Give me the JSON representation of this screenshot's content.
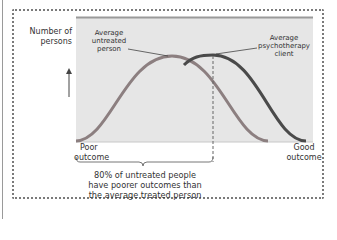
{
  "diagram": {
    "y_axis_label_line1": "Number of",
    "y_axis_label_line2": "persons",
    "x_axis_left_line1": "Poor",
    "x_axis_left_line2": "outcome",
    "x_axis_right_line1": "Good",
    "x_axis_right_line2": "outcome",
    "callout_untreated_line1": "Average",
    "callout_untreated_line2": "untreated",
    "callout_untreated_line3": "person",
    "callout_treated_line1": "Average",
    "callout_treated_line2": "psychotherapy",
    "callout_treated_line3": "client",
    "caption_line1": "80% of untreated people",
    "caption_line2": "have poorer outcomes than",
    "caption_line3": "the average treated person",
    "colors": {
      "plot_background": "#e6e6e6",
      "plot_top_border": "#9a9a9a",
      "untreated_curve": "#8c7f80",
      "treated_curve": "#4a4a4a",
      "frame_dots": "#7a7a7a"
    },
    "series": [
      {
        "name": "Average untreated person",
        "peak_x": 172,
        "role": "untreated distribution"
      },
      {
        "name": "Average psychotherapy client",
        "peak_x": 213,
        "role": "treated distribution"
      }
    ]
  }
}
